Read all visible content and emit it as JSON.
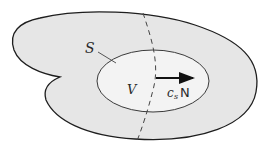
{
  "diagram": {
    "type": "region-diagram",
    "colors": {
      "outer_fill": "#e6e6e6",
      "inner_fill": "#f2f2f2",
      "stroke": "#1e1e1e",
      "inner_stroke": "#3a3a3a"
    },
    "labels": {
      "surface": "S",
      "volume": "V",
      "vector_coeff": "c",
      "vector_sub": "s",
      "vector_name": "N"
    },
    "elements": {
      "outer_region": "irregular closed region (shaded)",
      "inner_region": "ellipse V bounded by surface S",
      "dashed_curve": "dashed line crossing region",
      "arrow": "normal vector c_s N pointing right"
    }
  }
}
